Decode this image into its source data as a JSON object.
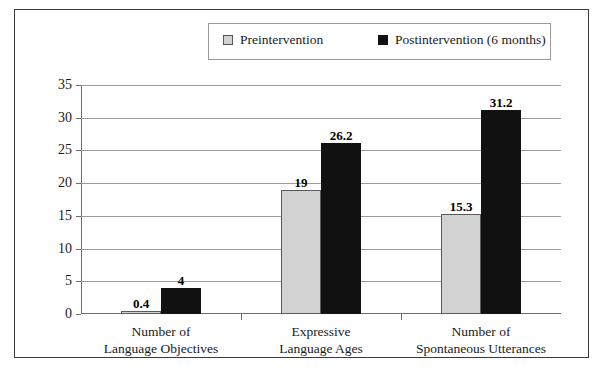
{
  "chart_data": {
    "type": "bar",
    "title": "",
    "xlabel": "",
    "ylabel": "",
    "ylim": [
      0,
      35
    ],
    "yticks": [
      0,
      5,
      10,
      15,
      20,
      25,
      30,
      35
    ],
    "grid": true,
    "legend_position": "top",
    "categories": [
      "Number of\nLanguage Objectives",
      "Expressive\nLanguage Ages",
      "Number of\nSpontaneous Utterances"
    ],
    "category_lines": [
      [
        "Number of",
        "Language Objectives"
      ],
      [
        "Expressive",
        "Language Ages"
      ],
      [
        "Number of",
        "Spontaneous Utterances"
      ]
    ],
    "series": [
      {
        "name": "Preintervention",
        "color": "#d2d2d2",
        "values": [
          0.4,
          19,
          15.3
        ],
        "labels": [
          "0.4",
          "19",
          "15.3"
        ]
      },
      {
        "name": "Postintervention (6 months)",
        "color": "#111111",
        "values": [
          4,
          26.2,
          31.2
        ],
        "labels": [
          "4",
          "26.2",
          "31.2"
        ]
      }
    ]
  },
  "legend": {
    "entries": [
      {
        "label": "Preintervention",
        "swatch": "legend-swatch-gray"
      },
      {
        "label": "Postintervention (6 months)",
        "swatch": "legend-swatch-black"
      }
    ]
  },
  "axis": {
    "y_tick_labels": [
      "0",
      "5",
      "10",
      "15",
      "20",
      "25",
      "30",
      "35"
    ]
  },
  "colors": {
    "preintervention": "#d2d2d2",
    "postintervention": "#111111",
    "frame": "#3a3a3a",
    "gridline": "#9c9c9c",
    "axis": "#6d6d6d"
  }
}
